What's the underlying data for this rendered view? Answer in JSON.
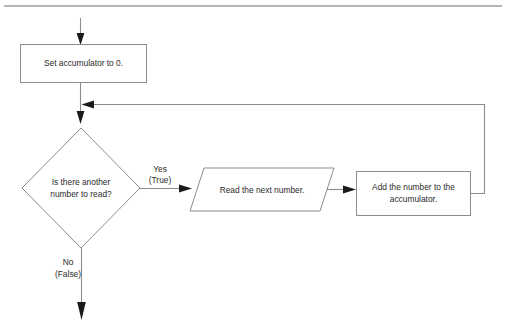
{
  "diagram": {
    "colors": {
      "shape_stroke": "#8c8c8c",
      "line": "#8c8c8c",
      "arrow_head": "#1a1a1a",
      "text": "#2b2b2b",
      "top_rule": "#b4b4b4",
      "background": "#ffffff"
    },
    "nodes": {
      "init": {
        "shape": "rectangle",
        "text": "Set accumulator to 0."
      },
      "decision": {
        "shape": "diamond",
        "line1": "Is there another",
        "line2": "number to read?"
      },
      "read": {
        "shape": "parallelogram",
        "text": "Read the next number."
      },
      "add": {
        "shape": "rectangle",
        "line1": "Add the number to the",
        "line2": "accumulator."
      }
    },
    "edges": {
      "yes": {
        "line1": "Yes",
        "line2": "(True)"
      },
      "no": {
        "line1": "No",
        "line2": "(False)"
      }
    }
  }
}
